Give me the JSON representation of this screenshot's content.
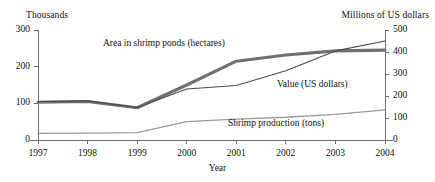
{
  "chart_data": {
    "type": "line",
    "title": "",
    "xlabel": "Year",
    "ylabel_left": "Thousands",
    "ylabel_right": "Millions of US dollars",
    "categories": [
      "1997",
      "1998",
      "1999",
      "2000",
      "2001",
      "2002",
      "2003",
      "2004"
    ],
    "x": [
      1997,
      1998,
      1999,
      2000,
      2001,
      2002,
      2003,
      2004
    ],
    "grid": false,
    "legend_position": "inline-annotations",
    "axes": {
      "left": {
        "label": "Thousands",
        "min": 0,
        "max": 300,
        "ticks": [
          0,
          100,
          200,
          300
        ],
        "tick_labels": [
          "0",
          "100",
          "200",
          "300"
        ]
      },
      "right": {
        "label": "Millions of US dollars",
        "min": 0,
        "max": 500,
        "ticks": [
          0,
          100,
          200,
          300,
          400,
          500
        ],
        "tick_labels": [
          "0",
          "100",
          "200",
          "300",
          "400",
          "500"
        ]
      },
      "x": {
        "label": "Year",
        "ticks": [
          "1997",
          "1998",
          "1999",
          "2000",
          "2001",
          "2002",
          "2003",
          "2004"
        ]
      }
    },
    "series": [
      {
        "name": "Area in shrimp ponds (hectares)",
        "axis": "left",
        "color": "#707070",
        "width": 3.1,
        "values": [
          103,
          105,
          88,
          150,
          215,
          232,
          243,
          245
        ]
      },
      {
        "name": "Value (US dollars)",
        "axis": "right",
        "color": "#4a4a4a",
        "width": 1.1,
        "values": [
          175,
          178,
          148,
          232,
          248,
          315,
          405,
          450
        ]
      },
      {
        "name": "Shrimp production (tons)",
        "axis": "left",
        "color": "#9a9a9a",
        "width": 1.3,
        "values": [
          18,
          19,
          20,
          50,
          57,
          62,
          70,
          82
        ]
      }
    ],
    "annotations": [
      {
        "text": "Area in shrimp ponds (hectares)",
        "series": "Area in shrimp ponds (hectares)"
      },
      {
        "text": "Value (US dollars)",
        "series": "Value (US dollars)"
      },
      {
        "text": "Shrimp production (tons)",
        "series": "Shrimp production (tons)"
      }
    ],
    "colors": {
      "axis": "#6f6f6f",
      "text": "#111111",
      "area_series": "#707070",
      "value_series": "#4a4a4a",
      "production_series": "#9a9a9a",
      "background": "#ffffff"
    }
  }
}
